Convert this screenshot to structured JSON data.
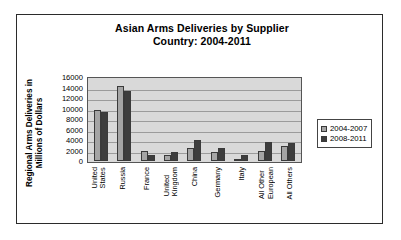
{
  "chart_data": {
    "type": "bar",
    "title": "Asian Arms Deliveries by Supplier Country: 2004-2011",
    "title_lines": [
      "Asian Arms Deliveries by Supplier",
      "Country: 2004-2011"
    ],
    "xlabel": "",
    "ylabel": "Regional Arms Deliveries in Millions of Dollars",
    "ylabel_lines": [
      "Regional Arms Deliveries in",
      "Millions of Dollars"
    ],
    "ylim": [
      0,
      16000
    ],
    "ytick_values": [
      16000,
      14000,
      12000,
      10000,
      8000,
      6000,
      4000,
      2000,
      0
    ],
    "ytick_labels": [
      "16000",
      "14000",
      "12000",
      "10000",
      "8000",
      "6000",
      "4000",
      "2000",
      "0"
    ],
    "grid": true,
    "legend_position": "right",
    "categories": [
      "United States",
      "Russia",
      "France",
      "United Kingdom",
      "China",
      "Germany",
      "Italy",
      "All Other European",
      "All Others"
    ],
    "category_label_lines": [
      [
        "United",
        "States"
      ],
      [
        "Russia"
      ],
      [
        "France"
      ],
      [
        "United",
        "Kingdom"
      ],
      [
        "China"
      ],
      [
        "Germany"
      ],
      [
        "Italy"
      ],
      [
        "All Other",
        "European"
      ],
      [
        "All Others"
      ]
    ],
    "series": [
      {
        "name": "2004-2007",
        "color": "#a5a5a5",
        "values": [
          9800,
          14300,
          2000,
          1100,
          2500,
          1700,
          300,
          1900,
          2800
        ]
      },
      {
        "name": "2008-2011",
        "color": "#3d3d3d",
        "values": [
          9400,
          13300,
          1200,
          1700,
          4000,
          2500,
          1100,
          3600,
          3500
        ]
      }
    ]
  },
  "legend": {
    "items": [
      {
        "label": "2004-2007",
        "color": "#a5a5a5"
      },
      {
        "label": "2008-2011",
        "color": "#3d3d3d"
      }
    ]
  }
}
